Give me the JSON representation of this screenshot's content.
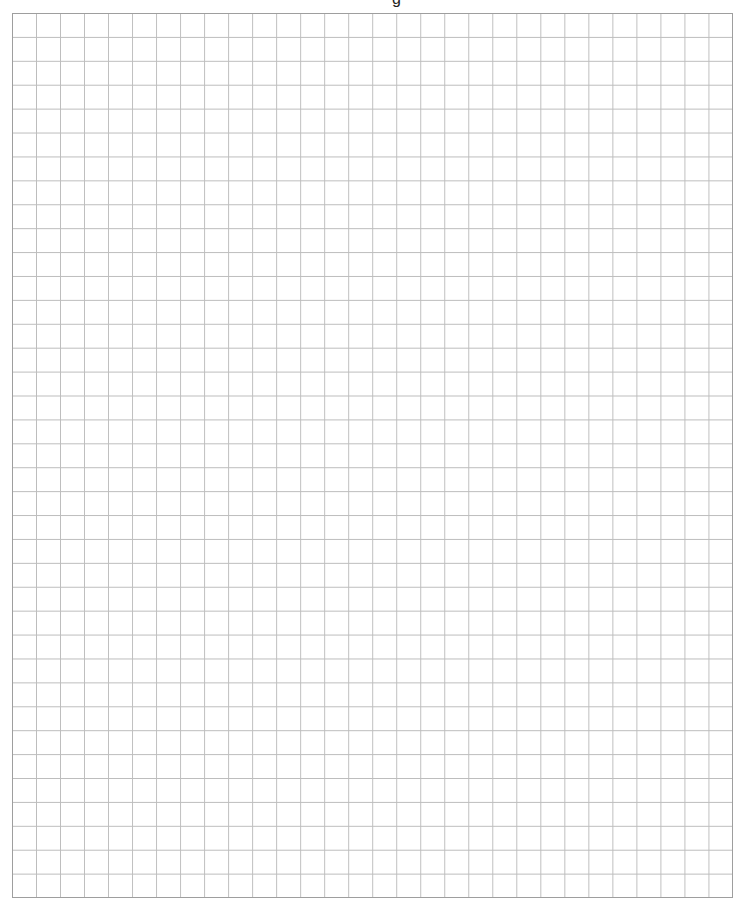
{
  "page": {
    "type": "graph-paper",
    "top_cut_text": "g"
  },
  "grid": {
    "columns": 30,
    "rows": 37,
    "cell_width_px": 24.03,
    "cell_height_px": 23.92,
    "line_color": "#bdbdbd",
    "border_color": "#9e9e9e",
    "background_color": "#ffffff"
  }
}
